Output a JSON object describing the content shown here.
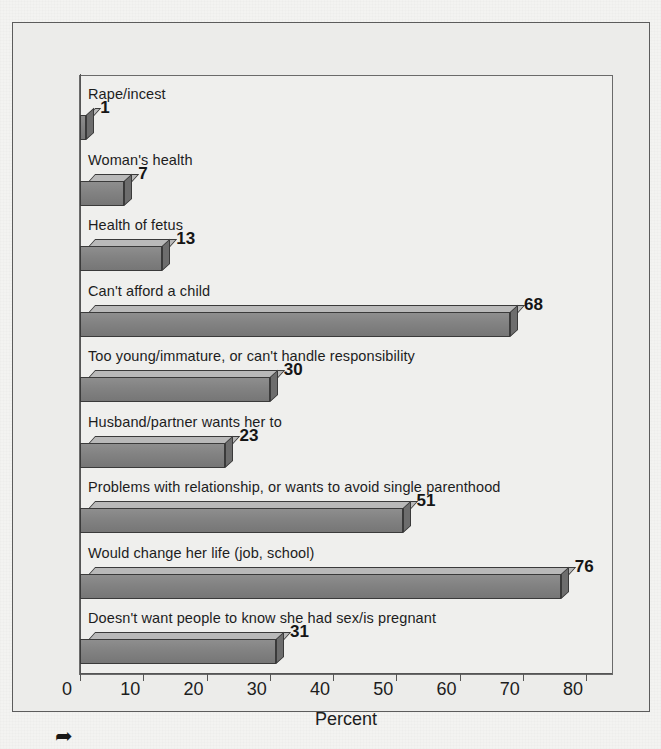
{
  "chart_data": {
    "type": "bar",
    "orientation": "horizontal",
    "title": "",
    "subtitle": "",
    "xlabel": "Percent",
    "ylabel": "",
    "xlim": [
      0,
      80
    ],
    "xticks": [
      0,
      10,
      20,
      30,
      40,
      50,
      60,
      70,
      80
    ],
    "xtick_labels": [
      "0",
      "10",
      "20",
      "30",
      "40",
      "50",
      "60",
      "70",
      "80"
    ],
    "grid": false,
    "legend": null,
    "style": "3d-shaded-bars",
    "categories": [
      "Rape/incest",
      "Woman's health",
      "Health of fetus",
      "Can't afford a child",
      "Too young/immature, or can't handle responsibility",
      "Husband/partner wants her to",
      "Problems with relationship, or wants to avoid single parenthood",
      "Would change her life (job, school)",
      "Doesn't want people to know she had sex/is pregnant"
    ],
    "values": [
      1,
      7,
      13,
      68,
      30,
      23,
      51,
      76,
      31
    ],
    "value_labels": [
      "1",
      "7",
      "13",
      "68",
      "30",
      "23",
      "51",
      "76",
      "31"
    ],
    "bar_color_front": "#828282",
    "bar_color_top": "#b9b9b9",
    "bar_color_side": "#6d6d6d",
    "bar_edge_color": "#3a3a3a"
  },
  "figure": {
    "background_color": "#efefed",
    "page_background_color": "#f3f3f1",
    "frame_color": "#5c5c5c",
    "artifact_glyph": "➦"
  }
}
